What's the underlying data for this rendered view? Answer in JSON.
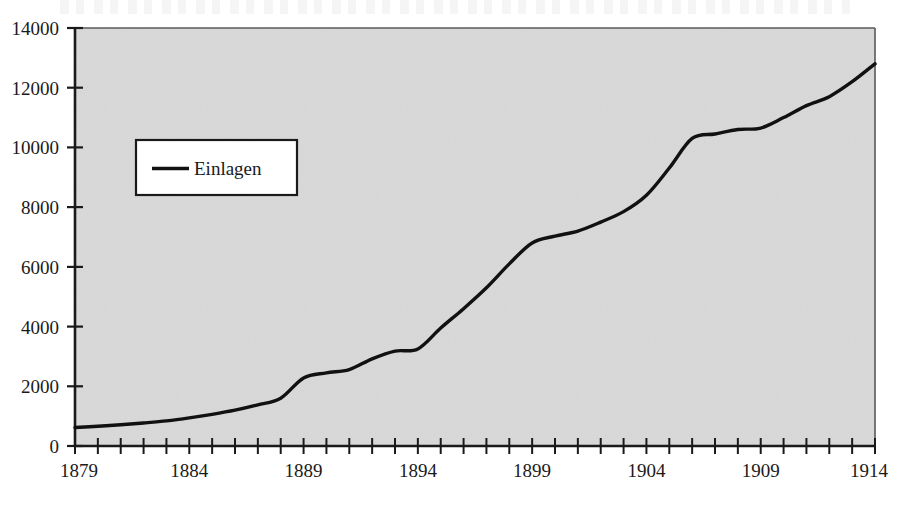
{
  "figure": {
    "background_color": "#ffffff",
    "plot_background_color": "#d9d9d9",
    "axis_color": "#1a1a1a",
    "series_color": "#111111",
    "title": "",
    "subtitle": ""
  },
  "legend": {
    "position": "inside-upper-left",
    "entries": [
      {
        "label": "Einlagen",
        "color": "#111111",
        "marker": "line"
      }
    ]
  },
  "axes": {
    "y_ticks": [
      "0",
      "2000",
      "4000",
      "6000",
      "8000",
      "10000",
      "12000",
      "14000"
    ],
    "x_ticks_labeled": [
      "1879",
      "1884",
      "1889",
      "1894",
      "1899",
      "1904",
      "1909",
      "1914"
    ],
    "x_label": "",
    "y_label": ""
  },
  "chart_data": {
    "type": "line",
    "title": "",
    "subtitle": "",
    "xlabel": "",
    "ylabel": "",
    "xlim": [
      1879,
      1914
    ],
    "ylim": [
      0,
      14000
    ],
    "yticks": [
      0,
      2000,
      4000,
      6000,
      8000,
      10000,
      12000,
      14000
    ],
    "xticks_labeled": [
      1879,
      1884,
      1889,
      1894,
      1899,
      1904,
      1909,
      1914
    ],
    "xticks_minor_every": 1,
    "grid": false,
    "legend_position": "upper left (inside plot)",
    "series": [
      {
        "name": "Einlagen",
        "color": "#111111",
        "x": [
          1879,
          1880,
          1881,
          1882,
          1883,
          1884,
          1885,
          1886,
          1887,
          1888,
          1889,
          1890,
          1891,
          1892,
          1893,
          1894,
          1895,
          1896,
          1897,
          1898,
          1899,
          1900,
          1901,
          1902,
          1903,
          1904,
          1905,
          1906,
          1907,
          1908,
          1909,
          1910,
          1911,
          1912,
          1913,
          1914
        ],
        "values": [
          620,
          660,
          710,
          770,
          840,
          940,
          1060,
          1200,
          1380,
          1600,
          2280,
          2450,
          2560,
          2920,
          3180,
          3250,
          3950,
          4600,
          5300,
          6100,
          6800,
          7030,
          7200,
          7500,
          7850,
          8400,
          9310,
          10300,
          10450,
          10600,
          10650,
          11000,
          11400,
          11700,
          12200,
          12800
        ]
      }
    ]
  }
}
